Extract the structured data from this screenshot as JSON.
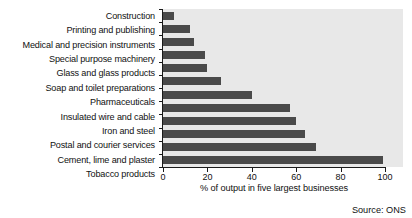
{
  "chart_data": {
    "type": "bar",
    "orientation": "horizontal",
    "title": "",
    "xlabel": "% of output in five largest businesses",
    "ylabel": "",
    "xlim": [
      0,
      100
    ],
    "xticks": [
      0,
      20,
      40,
      60,
      80,
      100
    ],
    "grid": false,
    "legend": false,
    "source": "Source: ONS",
    "bar_color": "#4a4a4a",
    "plot_background": "#e8e8e8",
    "categories": [
      "Construction",
      "Printing and publishing",
      "Medical and precision instruments",
      "Special purpose machinery",
      "Glass and glass products",
      "Soap and toilet preparations",
      "Pharmaceuticals",
      "Insulated wire and cable",
      "Iron and steel",
      "Postal and courier services",
      "Cement, lime and plaster",
      "Tobacco products"
    ],
    "values": [
      5,
      12,
      14,
      19,
      20,
      26,
      40,
      57,
      60,
      64,
      69,
      99
    ]
  }
}
